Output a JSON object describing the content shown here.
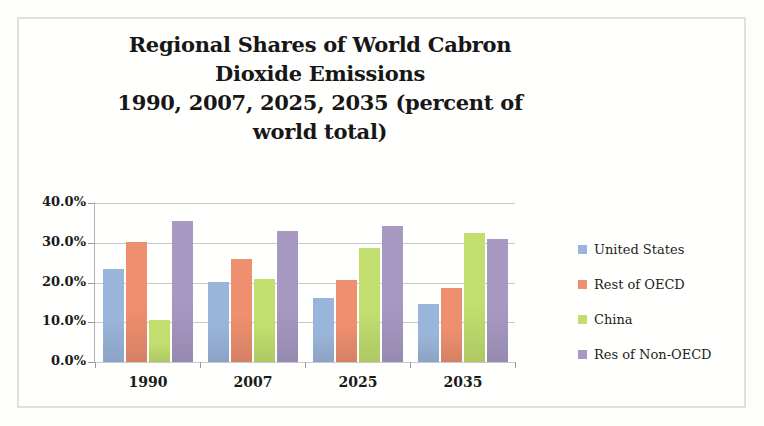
{
  "figure": {
    "frame_border_color": "#e2e0da",
    "background": "#fffffd"
  },
  "chart_data": {
    "type": "bar",
    "title": "Regional Shares of World Cabron Dioxide Emissions 1990, 2007, 2025, 2035 (percent of world total)",
    "title_lines": [
      "Regional Shares of World Cabron",
      "Dioxide Emissions",
      "1990, 2007, 2025, 2035 (percent of",
      "world total)"
    ],
    "xlabel": "",
    "ylabel": "",
    "categories": [
      "1990",
      "2007",
      "2025",
      "2035"
    ],
    "series": [
      {
        "name": "United States",
        "color": "#9ab5da",
        "values": [
          23.5,
          20.2,
          16.2,
          14.7
        ]
      },
      {
        "name": "Rest of OECD",
        "color": "#ee8f6f",
        "values": [
          30.3,
          25.8,
          20.6,
          18.6
        ]
      },
      {
        "name": "China",
        "color": "#c2de6f",
        "values": [
          10.5,
          21.0,
          28.6,
          32.5
        ]
      },
      {
        "name": "Res of Non-OECD",
        "color": "#a899c3",
        "values": [
          35.5,
          32.9,
          34.1,
          31.0
        ]
      }
    ],
    "ylim": [
      0,
      40
    ],
    "ytick_values": [
      0,
      10,
      20,
      30,
      40
    ],
    "ytick_labels": [
      "0.0%",
      "10.0%",
      "20.0%",
      "30.0%",
      "40.0%"
    ],
    "grid": true,
    "grid_axis": "y",
    "legend_position": "right",
    "value_suffix": "%"
  }
}
